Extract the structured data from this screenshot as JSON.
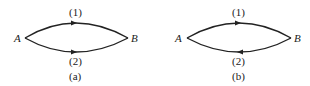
{
  "figures": [
    {
      "id": "a",
      "caption": "(a)",
      "nodes": {
        "left": "A",
        "right": "B"
      },
      "paths": [
        {
          "label": "(1)",
          "position": "top",
          "direction": "A-to-B"
        },
        {
          "label": "(2)",
          "position": "bottom",
          "direction": "A-to-B"
        }
      ]
    },
    {
      "id": "b",
      "caption": "(b)",
      "nodes": {
        "left": "A",
        "right": "B"
      },
      "paths": [
        {
          "label": "(1)",
          "position": "top",
          "direction": "A-to-B"
        },
        {
          "label": "(2)",
          "position": "bottom",
          "direction": "B-to-A"
        }
      ]
    }
  ],
  "colors": {
    "stroke": "#222222",
    "background": "#ffffff"
  }
}
